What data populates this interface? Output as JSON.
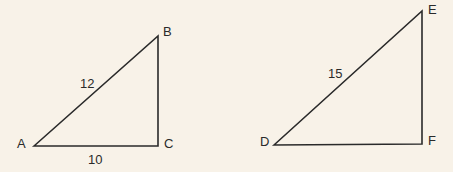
{
  "diagram": {
    "background": "#f8f2e8",
    "stroke_color": "#2a2a2a",
    "triangles": [
      {
        "vertices": {
          "A": {
            "label": "A"
          },
          "B": {
            "label": "B"
          },
          "C": {
            "label": "C"
          }
        },
        "sides": {
          "AB": "12",
          "AC": "10"
        }
      },
      {
        "vertices": {
          "D": {
            "label": "D"
          },
          "E": {
            "label": "E"
          },
          "F": {
            "label": "F"
          }
        },
        "sides": {
          "DE": "15"
        }
      }
    ]
  }
}
